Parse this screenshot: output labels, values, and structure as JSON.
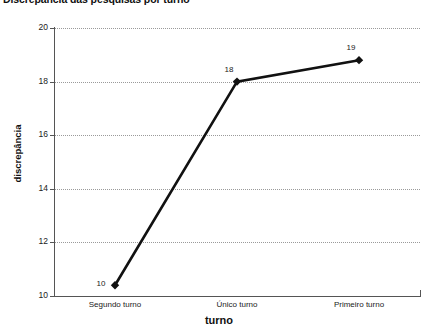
{
  "chart_data": {
    "type": "line",
    "title": "Discrepância das pesquisas por turno",
    "xlabel": "turno",
    "ylabel": "discrepância",
    "categories": [
      "Segundo turno",
      "Único turno",
      "Primeiro turno"
    ],
    "values": [
      10.4,
      18.0,
      18.8
    ],
    "point_labels": [
      "10",
      "18",
      "19"
    ],
    "yticks": [
      "10",
      "12",
      "14",
      "16",
      "18",
      "20"
    ],
    "ytick_values": [
      10,
      12,
      14,
      16,
      18,
      20
    ],
    "ylim": [
      10,
      20
    ],
    "grid": true,
    "legend": "none",
    "marker": "diamond",
    "line_color": "#111111",
    "grid_color": "#9a9a9a",
    "axis_color": "#555555",
    "background": "#ffffff"
  },
  "axis": {
    "y": {
      "ticks": [
        {
          "label": "20",
          "value": 20
        },
        {
          "label": "18",
          "value": 18
        },
        {
          "label": "16",
          "value": 16
        },
        {
          "label": "14",
          "value": 14
        },
        {
          "label": "12",
          "value": 12
        },
        {
          "label": "10",
          "value": 10
        }
      ]
    },
    "x": {
      "categories": [
        {
          "label": "Segundo turno"
        },
        {
          "label": "Único turno"
        },
        {
          "label": "Primeiro turno"
        }
      ]
    }
  },
  "points": [
    {
      "label": "10",
      "category": "Segundo turno",
      "value": 10.4
    },
    {
      "label": "18",
      "category": "Único turno",
      "value": 18.0
    },
    {
      "label": "19",
      "category": "Primeiro turno",
      "value": 18.8
    }
  ]
}
